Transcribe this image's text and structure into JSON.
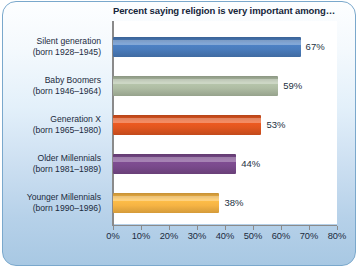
{
  "chart_data": {
    "type": "bar",
    "orientation": "horizontal",
    "title": "Percent saying religion is very important among…",
    "xlabel": "",
    "ylabel": "",
    "xlim": [
      0,
      80
    ],
    "grid": false,
    "legend": "none",
    "xticks": [
      "0%",
      "10%",
      "20%",
      "30%",
      "40%",
      "50%",
      "60%",
      "70%",
      "80%"
    ],
    "xtick_values": [
      0,
      10,
      20,
      30,
      40,
      50,
      60,
      70,
      80
    ],
    "categories": [
      "Silent generation",
      "Baby Boomers",
      "Generation X",
      "Older Millennials",
      "Younger Millennials"
    ],
    "category_sublabels": [
      "(born 1928–1945)",
      "(born 1946–1964)",
      "(born 1965–1980)",
      "(born 1981–1989)",
      "(born 1990–1996)"
    ],
    "values": [
      67,
      59,
      53,
      44,
      38
    ],
    "value_labels": [
      "67%",
      "59%",
      "53%",
      "44%",
      "38%"
    ],
    "bar_colors": [
      "#4a7cbc",
      "#aebca3",
      "#e2561f",
      "#7a4a8c",
      "#f6b444"
    ]
  },
  "style": {
    "border_color": "#7aa8cc",
    "panel_top_color": "#fdfeff",
    "panel_bottom_color": "#a8c8e3",
    "plot_background": "#ffffff",
    "axis_color": "#8a8a8a",
    "title_color": "#15253a",
    "label_color": "#1b2b3d"
  }
}
